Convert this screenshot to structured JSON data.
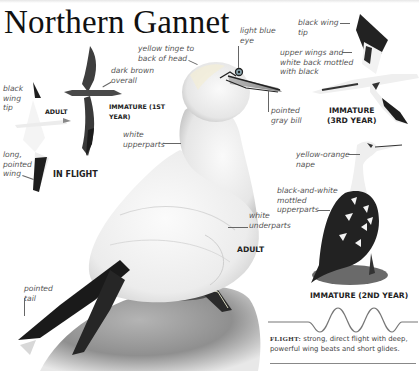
{
  "header": {
    "title": "Northern Gannet"
  },
  "illustrations": {
    "adult_in_flight": {
      "caption": "ADULT",
      "group_caption": "IN FLIGHT",
      "labels": [
        {
          "line1": "black",
          "line2": "wing",
          "line3": "tip"
        },
        {
          "line1": "long,",
          "line2": "pointed",
          "line3": "wing"
        }
      ]
    },
    "immature_1st_year": {
      "caption_line1": "IMMATURE (1ST",
      "caption_line2": "YEAR)",
      "labels": [
        {
          "line1": "dark brown",
          "line2": "overall"
        }
      ]
    },
    "adult_perched": {
      "caption": "ADULT",
      "labels": [
        {
          "line1": "yellow tinge to",
          "line2": "back of head"
        },
        {
          "line1": "light blue",
          "line2": "eye"
        },
        {
          "line1": "pointed",
          "line2": "gray bill"
        },
        {
          "line1": "white",
          "line2": "upperparts"
        },
        {
          "line1": "white",
          "line2": "underparts"
        },
        {
          "line1": "pointed",
          "line2": "tail"
        }
      ]
    },
    "immature_3rd_year": {
      "caption_line1": "IMMATURE",
      "caption_line2": "(3RD YEAR)",
      "labels": [
        {
          "line1": "black wing",
          "line2": "tip"
        },
        {
          "line1": "upper wings and",
          "line2": "white back mottled",
          "line3": "with black"
        }
      ]
    },
    "immature_2nd_year": {
      "caption": "IMMATURE (2ND YEAR)",
      "labels": [
        {
          "line1": "yellow-orange",
          "line2": "nape"
        },
        {
          "line1": "black-and-white",
          "line2": "mottled",
          "line3": "upperparts"
        }
      ]
    }
  },
  "flight": {
    "heading": "FLIGHT:",
    "description": " strong, direct flight with deep, powerful wing beats and short glides.",
    "pattern_icon": "wavy-flight-path"
  },
  "colors": {
    "ink": "#111111",
    "label_gray": "#555555",
    "rock_gray": "#9a9a9a",
    "plumage_black": "#1a1a1a",
    "immature_brown": "#3c3c3c"
  }
}
